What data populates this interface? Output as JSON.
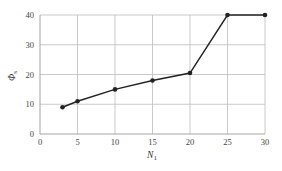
{
  "chart_data": {
    "type": "line",
    "title": "",
    "xlabel": "N_1",
    "ylabel": "Φ_s",
    "xlim": [
      0,
      30
    ],
    "ylim": [
      0,
      40
    ],
    "xticks": [
      0,
      5,
      10,
      15,
      20,
      25,
      30
    ],
    "yticks": [
      0,
      10,
      20,
      30,
      40
    ],
    "grid": true,
    "legend": null,
    "series": [
      {
        "name": "Φ_s",
        "x": [
          3,
          5,
          10,
          15,
          20,
          25,
          30
        ],
        "y": [
          9,
          11,
          15,
          18,
          20.5,
          40,
          40
        ],
        "marker": "circle",
        "color": "#222222"
      }
    ]
  },
  "axes": {
    "xlabel_main": "N",
    "xlabel_sub": "1",
    "ylabel_main": "Φ",
    "ylabel_sub": "s"
  }
}
